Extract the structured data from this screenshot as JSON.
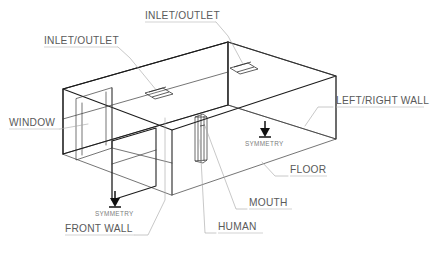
{
  "diagram": {
    "type": "isometric-wireframe",
    "stroke_color": "#1b1b1b",
    "leader_color": "#a6a6a6",
    "label_color": "#5a5a5a",
    "background": "#ffffff"
  },
  "labels": {
    "inlet_outlet_left": "INLET/OUTLET",
    "inlet_outlet_top": "INLET/OUTLET",
    "window": "WINDOW",
    "left_right_wall": "LEFT/RIGHT WALL",
    "floor": "FLOOR",
    "mouth": "MOUTH",
    "human": "HUMAN",
    "front_wall": "FRONT WALL",
    "symmetry_left": "SYMMETRY",
    "symmetry_right": "SYMMETRY"
  },
  "annotations": {
    "symmetry_arrow_count": "2",
    "vent_count": "2",
    "human_count": "1"
  }
}
